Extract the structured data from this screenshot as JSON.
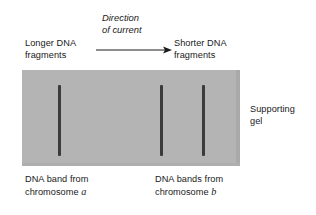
{
  "figure": {
    "colors": {
      "gel": "#b4b4b4",
      "band": "#3b3b3b",
      "text": "#1a1a1a",
      "background": "#ffffff"
    }
  },
  "annotations": {
    "direction_line1": "Direction",
    "direction_line2": "of current",
    "longer_fragments": "Longer DNA\nfragments",
    "shorter_fragments": "Shorter DNA\nfragments",
    "supporting_gel": "Supporting\ngel",
    "band_a_line1": "DNA band from",
    "band_a_line2": "chromosome ",
    "band_a_symbol": "a",
    "band_b_line1": "DNA bands from",
    "band_b_line2": "chromosome ",
    "band_b_symbol": "b"
  },
  "gel": {
    "x": 22,
    "y": 70,
    "width": 218,
    "height": 96,
    "bands": [
      {
        "id": "band-1",
        "label": "chromosome a band",
        "x": 58,
        "y": 85,
        "width": 3,
        "height": 71
      },
      {
        "id": "band-2",
        "label": "chromosome b band 1",
        "x": 160,
        "y": 85,
        "width": 3,
        "height": 71
      },
      {
        "id": "band-3",
        "label": "chromosome b band 2",
        "x": 202,
        "y": 85,
        "width": 3,
        "height": 71
      }
    ]
  },
  "arrow": {
    "name": "direction-of-current-arrow",
    "from_x": 0,
    "to_x": 76,
    "y": 6
  }
}
